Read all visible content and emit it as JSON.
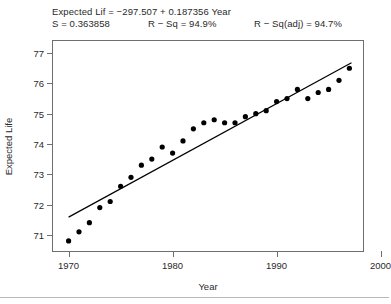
{
  "header": {
    "equation": "Expected Lif = −297.507 + 0.187356 Year",
    "s_label": "S = 0.363858",
    "rsq_label": "R − Sq = 94.9%",
    "rsqadj_label": "R − Sq(adj) = 94.7%"
  },
  "chart_data": {
    "type": "scatter",
    "title": "",
    "xlabel": "Year",
    "ylabel": "Expected Life",
    "xlim": [
      1968.5,
      1998.5
    ],
    "ylim": [
      70.4,
      77.4
    ],
    "xticks": [
      1970,
      1980,
      1990,
      2000
    ],
    "xtick_labels": [
      "1970",
      "1980",
      "1990",
      "2000"
    ],
    "yticks": [
      71,
      72,
      73,
      74,
      75,
      76,
      77
    ],
    "ytick_labels": [
      "71",
      "72",
      "73",
      "74",
      "75",
      "76",
      "77"
    ],
    "grid": false,
    "legend": "none",
    "marker": "filled-circle",
    "marker_color": "#000000",
    "line_color": "#000000",
    "frame_color": "#6f6f6f",
    "x": [
      1970,
      1971,
      1972,
      1973,
      1974,
      1975,
      1976,
      1977,
      1978,
      1979,
      1980,
      1981,
      1982,
      1983,
      1984,
      1985,
      1986,
      1987,
      1988,
      1989,
      1990,
      1991,
      1992,
      1993,
      1994,
      1995,
      1996,
      1997
    ],
    "y": [
      70.8,
      71.1,
      71.4,
      71.9,
      72.1,
      72.6,
      72.9,
      73.3,
      73.5,
      73.9,
      73.7,
      74.1,
      74.5,
      74.7,
      74.8,
      74.7,
      74.7,
      74.9,
      75.0,
      75.1,
      75.4,
      75.5,
      75.8,
      75.5,
      75.7,
      75.8,
      76.1,
      76.5
    ],
    "fit": {
      "label": "regression-line",
      "intercept": -297.507,
      "slope": 0.187356,
      "x_start": 1970.0,
      "x_end": 1997.2
    },
    "stats": {
      "s": 0.363858,
      "r_sq": "94.9%",
      "r_sq_adj": "94.7%"
    }
  }
}
